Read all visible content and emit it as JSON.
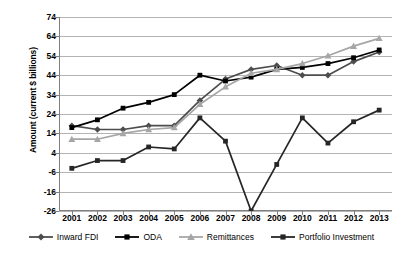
{
  "chart_data": {
    "type": "line",
    "title": "",
    "xlabel": "",
    "ylabel": "Amount (current $ billions)",
    "categories": [
      "2001",
      "2002",
      "2003",
      "2004",
      "2005",
      "2006",
      "2007",
      "2008",
      "2009",
      "2010",
      "2011",
      "2012",
      "2013"
    ],
    "ylim": [
      -26,
      74
    ],
    "ytick_step": 10,
    "yticks": [
      74,
      64,
      54,
      44,
      34,
      24,
      14,
      4,
      -6,
      -16,
      -26
    ],
    "grid": true,
    "legend_position": "bottom",
    "series": [
      {
        "name": "Inward FDI",
        "color": "#4d4d4d",
        "marker": "diamond",
        "values": [
          18,
          16,
          16,
          18,
          18,
          31,
          42,
          47,
          49,
          44,
          44,
          51,
          56
        ]
      },
      {
        "name": "ODA",
        "color": "#000000",
        "marker": "square",
        "values": [
          17,
          21,
          27,
          30,
          34,
          44,
          41,
          43,
          47,
          48,
          50,
          53,
          57
        ]
      },
      {
        "name": "Remittances",
        "color": "#a6a6a6",
        "marker": "triangle",
        "values": [
          11,
          11,
          14,
          16,
          17,
          29,
          38,
          45,
          47,
          50,
          54,
          59,
          63
        ]
      },
      {
        "name": "Portfolio Investment",
        "color": "#262626",
        "marker": "square",
        "values": [
          -4,
          0,
          0,
          7,
          6,
          22,
          10,
          -26,
          -2,
          22,
          9,
          20,
          26
        ]
      }
    ]
  },
  "legend": {
    "items": [
      {
        "label": "Inward FDI"
      },
      {
        "label": "ODA"
      },
      {
        "label": "Remittances"
      },
      {
        "label": "Portfolio Investment"
      }
    ]
  }
}
